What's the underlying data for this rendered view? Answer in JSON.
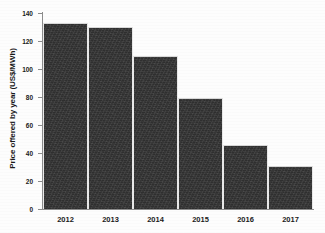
{
  "chart_data": {
    "type": "bar",
    "title": "",
    "xlabel": "",
    "ylabel": "Price offered by year (US$/MWh)",
    "categories": [
      "2012",
      "2013",
      "2014",
      "2015",
      "2016",
      "2017"
    ],
    "values": [
      133,
      130,
      109,
      79,
      46,
      31
    ],
    "ylim": [
      0,
      140
    ],
    "yticks": [
      0,
      20,
      40,
      60,
      80,
      100,
      120,
      140
    ],
    "ytick_labels": [
      "0",
      "20",
      "40",
      "60",
      "80",
      "100",
      "120",
      "140"
    ],
    "grid": false,
    "legend": null,
    "bar_color": "#343434",
    "axis_color": "#8c8c8c",
    "text_color": "#1a1a1a",
    "background": "#fdfdfd"
  }
}
